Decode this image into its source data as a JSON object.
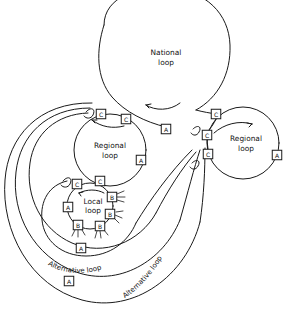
{
  "diagram": {
    "background_color": "#ffffff",
    "line_color": "#1a1a1a",
    "labels": {
      "national": {
        "line1": "National",
        "line2": "loop"
      },
      "regional_left": {
        "line1": "Regional",
        "line2": "loop"
      },
      "regional_right": {
        "line1": "Regional",
        "line2": "loop"
      },
      "local": {
        "line1": "Local",
        "line2": "loop"
      },
      "alternative_1": "Alternative loop",
      "alternative_2": "Alternative loop"
    },
    "nodes": [
      {
        "id": "n1",
        "label": "C",
        "x": 101,
        "y": 114,
        "loop": "regional-left"
      },
      {
        "id": "n2",
        "label": "C",
        "x": 126,
        "y": 119,
        "loop": "regional-left"
      },
      {
        "id": "n3",
        "label": "A",
        "x": 141,
        "y": 160,
        "loop": "regional-left"
      },
      {
        "id": "n4",
        "label": "C",
        "x": 100,
        "y": 181,
        "loop": "regional-left"
      },
      {
        "id": "n5",
        "label": "C",
        "x": 77,
        "y": 184,
        "loop": "local"
      },
      {
        "id": "n6",
        "label": "A",
        "x": 68,
        "y": 207,
        "loop": "local"
      },
      {
        "id": "n7",
        "label": "B",
        "x": 78,
        "y": 225,
        "loop": "local"
      },
      {
        "id": "n8",
        "label": "B",
        "x": 100,
        "y": 226,
        "loop": "local"
      },
      {
        "id": "n9",
        "label": "B",
        "x": 110,
        "y": 214,
        "loop": "local"
      },
      {
        "id": "n10",
        "label": "B",
        "x": 112,
        "y": 197,
        "loop": "local"
      },
      {
        "id": "n11",
        "label": "A",
        "x": 166,
        "y": 129,
        "loop": "national"
      },
      {
        "id": "n12",
        "label": "C",
        "x": 216,
        "y": 114,
        "loop": "national"
      },
      {
        "id": "n13",
        "label": "C",
        "x": 207,
        "y": 135,
        "loop": "regional-right"
      },
      {
        "id": "n14",
        "label": "C",
        "x": 208,
        "y": 154,
        "loop": "regional-right"
      },
      {
        "id": "n15",
        "label": "A",
        "x": 277,
        "y": 155,
        "loop": "regional-right"
      },
      {
        "id": "n16",
        "label": "A",
        "x": 81,
        "y": 248,
        "loop": "alternative-1"
      },
      {
        "id": "n17",
        "label": "A",
        "x": 69,
        "y": 281,
        "loop": "alternative-2"
      }
    ],
    "node_legend": {
      "A": "A",
      "B": "B",
      "C": "C"
    }
  }
}
